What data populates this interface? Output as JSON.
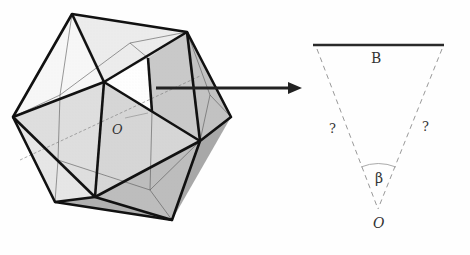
{
  "figure": {
    "left_panel": {
      "shape": "icosahedron",
      "center_label": "O",
      "fill_light": "#e8e8e8",
      "fill_mid": "#d4d4d4",
      "fill_dark": "#b8b8b8",
      "edge_color": "#111111"
    },
    "arrow": {
      "color": "#222222"
    },
    "right_panel": {
      "base_label": "B",
      "left_side_label": "?",
      "right_side_label": "?",
      "angle_label": "β",
      "apex_label": "O",
      "base_color": "#2a2a2a",
      "dashed_color": "#999999"
    }
  }
}
